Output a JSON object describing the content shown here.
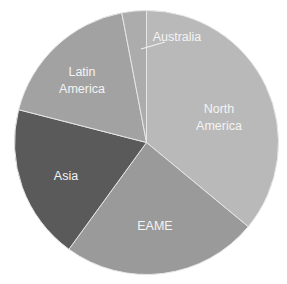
{
  "chart_data": {
    "type": "pie",
    "title": "",
    "start_angle_deg": 0,
    "direction": "clockwise",
    "slices": [
      {
        "label": "North America",
        "lines": [
          "North",
          "America"
        ],
        "value": 36,
        "color": "#b9b9b9"
      },
      {
        "label": "EAME",
        "lines": [
          "EAME"
        ],
        "value": 24,
        "color": "#9a9a9a"
      },
      {
        "label": "Asia",
        "lines": [
          "Asia"
        ],
        "value": 19,
        "color": "#5a5a5a"
      },
      {
        "label": "Latin America",
        "lines": [
          "Latin",
          "America"
        ],
        "value": 18,
        "color": "#a2a2a2"
      },
      {
        "label": "Australia",
        "lines": [
          "Australia"
        ],
        "value": 3,
        "color": "#acacac"
      }
    ],
    "legend": "none",
    "labels_inside": true,
    "separator_color": "#e6e6e6"
  }
}
